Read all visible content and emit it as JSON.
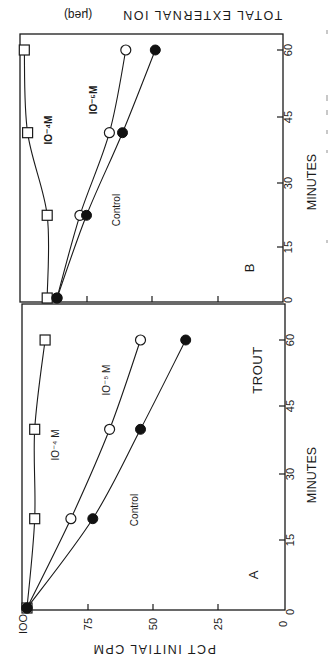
{
  "figure": {
    "orientation": "rotated 90 degrees clockwise",
    "top_axis_title": "TOTAL EXTERNAL ION",
    "top_axis_unit": "(μeq)",
    "bottom_axis_title": "PCT INITIAL CPM",
    "x_axis_title": "MINUTES",
    "trout_label": "TROUT"
  },
  "chart_data": [
    {
      "panel": "A",
      "type": "line",
      "title": "TROUT",
      "xlabel": "MINUTES",
      "ylabel": "PCT INITIAL CPM",
      "x": [
        0,
        20,
        40,
        60
      ],
      "xticks": [
        0,
        15,
        30,
        45,
        60
      ],
      "yticks": [
        0,
        25,
        50,
        75,
        100
      ],
      "xlim": [
        0,
        60
      ],
      "ylim": [
        0,
        100
      ],
      "grid": false,
      "series": [
        {
          "name": "10⁻⁴ M",
          "marker": "open-square",
          "values": [
            100,
            97,
            97,
            93
          ]
        },
        {
          "name": "10⁻⁵ M",
          "marker": "open-circle",
          "values": [
            100,
            83,
            68,
            56
          ]
        },
        {
          "name": "Control",
          "marker": "filled-circle",
          "values": [
            100,
            74.5,
            56,
            38.5
          ]
        }
      ]
    },
    {
      "panel": "B",
      "type": "line",
      "title": "",
      "xlabel": "MINUTES",
      "ylabel": "TOTAL EXTERNAL ION (μeq)",
      "x": [
        0,
        20,
        40,
        60
      ],
      "xticks": [
        0,
        15,
        30,
        45,
        60
      ],
      "yticks_note": "unlabeled tick marks; values in tick-interval units",
      "yticks": [
        0,
        1,
        2,
        3
      ],
      "xlim": [
        0,
        60
      ],
      "ylim": [
        0,
        4
      ],
      "grid": false,
      "series": [
        {
          "name": "10⁻⁴ M",
          "marker": "open-square",
          "values": [
            3.6,
            3.6,
            3.9,
            3.95
          ]
        },
        {
          "name": "10⁻⁵ M",
          "marker": "open-circle",
          "values": [
            3.45,
            3.1,
            2.65,
            2.4
          ]
        },
        {
          "name": "Control",
          "marker": "filled-circle",
          "values": [
            3.45,
            3.0,
            2.45,
            1.95
          ]
        }
      ]
    }
  ],
  "labels": {
    "panel_a": "A",
    "panel_b": "B",
    "a_series": {
      "s1": "IO⁻⁴ M",
      "s2": "IO⁻⁵ M",
      "s3": "Control"
    },
    "b_series": {
      "s1": "IO⁻⁴M",
      "s2": "IO⁻⁵M",
      "s3": "Control"
    },
    "a_xticks": [
      "0",
      "15",
      "30",
      "45",
      "60"
    ],
    "b_xticks": [
      "0",
      "15",
      "30",
      "45",
      "60"
    ],
    "a_yticks": [
      "IOO",
      "75",
      "50",
      "25",
      "0"
    ]
  }
}
